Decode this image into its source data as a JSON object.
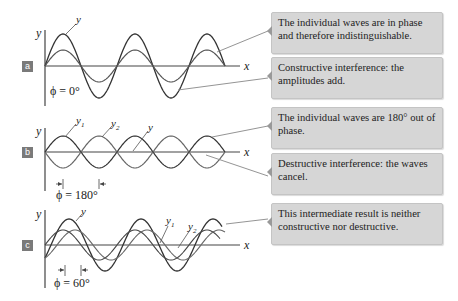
{
  "panels": [
    {
      "id": "a",
      "label": "a",
      "phase_label": "ϕ = 0°",
      "axis_x": "x",
      "axis_y": "y",
      "curve_labels": {
        "y": "y"
      },
      "callouts": [
        {
          "text": "The individual waves are in phase and therefore indistinguishable."
        },
        {
          "text": "Constructive interference: the amplitudes add."
        }
      ]
    },
    {
      "id": "b",
      "label": "b",
      "phase_label": "ϕ = 180°",
      "axis_x": "x",
      "axis_y": "y",
      "curve_labels": {
        "y1": "y",
        "y1_sub": "1",
        "y2": "y",
        "y2_sub": "2",
        "y": "y"
      },
      "callouts": [
        {
          "text": "The individual waves are 180° out of phase."
        },
        {
          "text": "Destructive interference: the waves cancel."
        }
      ]
    },
    {
      "id": "c",
      "label": "c",
      "phase_label": "ϕ = 60°",
      "axis_x": "x",
      "axis_y": "y",
      "curve_labels": {
        "y": "y",
        "y1": "y",
        "y1_sub": "1",
        "y2": "y",
        "y2_sub": "2"
      },
      "callouts": [
        {
          "text": "This intermediate result is neither constructive nor destructive."
        }
      ]
    }
  ],
  "colors": {
    "callout_bg": "#d6d6d6",
    "panel_label_bg": "#7a7a7a",
    "resultant_wave": "#333333",
    "component_wave": "#555555",
    "leader_line": "#888888"
  }
}
